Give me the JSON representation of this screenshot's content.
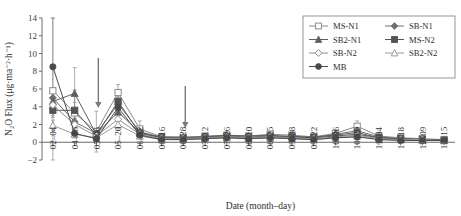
{
  "chart_data": {
    "type": "line",
    "title": "",
    "xlabel": "Date (month–day)",
    "ylabel": "N₂O Flux (μg·ma⁻²·h⁻¹)",
    "ylim": [
      -2,
      14
    ],
    "yticks": [
      -2,
      0,
      2,
      4,
      6,
      8,
      10,
      12,
      14
    ],
    "grid": false,
    "legend_position": "top-right",
    "categories": [
      "02–04",
      "04–15",
      "05–06",
      "05–20",
      "06–02",
      "06–16",
      "06–28",
      "07–12",
      "07–26",
      "08–10",
      "08–25",
      "09–08",
      "09–22",
      "10–06",
      "10–20",
      "11–04",
      "11–18",
      "12–09",
      "12–15"
    ],
    "series": [
      {
        "name": "MS-N1",
        "marker": "open-square",
        "color": "#8a8a8a",
        "values": [
          5.8,
          3.3,
          1.2,
          5.6,
          1.5,
          0.6,
          0.5,
          0.7,
          0.8,
          0.7,
          0.9,
          0.8,
          0.6,
          1.0,
          1.8,
          0.7,
          0.5,
          0.4,
          0.3
        ],
        "errors": [
          8.2,
          2.6,
          2.3,
          0.9,
          0.9,
          0.4,
          0.3,
          0.3,
          0.3,
          0.3,
          0.3,
          0.3,
          0.3,
          0.4,
          0.6,
          0.3,
          0.2,
          0.2,
          0.2
        ]
      },
      {
        "name": "SB-N1",
        "marker": "filled-diamond",
        "color": "#6f6f6f",
        "values": [
          5.0,
          2.3,
          1.0,
          4.3,
          1.2,
          0.5,
          0.5,
          0.6,
          0.7,
          0.6,
          0.7,
          0.7,
          0.5,
          0.9,
          1.3,
          0.6,
          0.4,
          0.3,
          0.3
        ],
        "errors": [
          1.1,
          1.0,
          0.5,
          0.8,
          0.5,
          0.3,
          0.2,
          0.2,
          0.2,
          0.2,
          0.2,
          0.2,
          0.2,
          0.3,
          0.4,
          0.2,
          0.2,
          0.2,
          0.1
        ]
      },
      {
        "name": "SB2-N1",
        "marker": "filled-triangle",
        "color": "#5f5f5f",
        "values": [
          4.6,
          5.5,
          0.9,
          3.4,
          1.1,
          0.6,
          0.6,
          0.6,
          0.8,
          0.7,
          0.8,
          0.6,
          0.6,
          0.8,
          1.1,
          0.5,
          0.4,
          0.3,
          0.3
        ],
        "errors": [
          0.9,
          2.9,
          0.4,
          0.7,
          0.4,
          0.3,
          0.2,
          0.2,
          0.2,
          0.2,
          0.2,
          0.2,
          0.2,
          0.2,
          0.3,
          0.2,
          0.2,
          0.1,
          0.1
        ]
      },
      {
        "name": "MS-N2",
        "marker": "filled-square",
        "color": "#545454",
        "values": [
          3.6,
          3.6,
          0.8,
          4.6,
          1.0,
          0.5,
          0.4,
          0.5,
          0.6,
          0.5,
          0.6,
          0.6,
          0.5,
          0.7,
          0.9,
          0.5,
          0.4,
          0.3,
          0.2
        ],
        "errors": [
          0.8,
          0.9,
          0.4,
          0.9,
          0.4,
          0.2,
          0.2,
          0.2,
          0.2,
          0.2,
          0.2,
          0.2,
          0.2,
          0.2,
          0.3,
          0.2,
          0.1,
          0.1,
          0.1
        ]
      },
      {
        "name": "SB-N2",
        "marker": "open-diamond",
        "color": "#909090",
        "values": [
          4.2,
          2.0,
          0.7,
          2.6,
          0.9,
          0.4,
          0.4,
          0.5,
          0.6,
          0.5,
          0.6,
          0.5,
          0.4,
          0.6,
          0.8,
          0.4,
          0.3,
          0.3,
          0.2
        ],
        "errors": [
          0.8,
          0.7,
          0.3,
          0.6,
          0.3,
          0.2,
          0.2,
          0.2,
          0.2,
          0.2,
          0.2,
          0.2,
          0.2,
          0.2,
          0.3,
          0.2,
          0.1,
          0.1,
          0.1
        ]
      },
      {
        "name": "SB2-N2",
        "marker": "open-triangle",
        "color": "#9b9b9b",
        "values": [
          1.9,
          0.9,
          0.5,
          2.0,
          0.7,
          0.3,
          0.3,
          0.4,
          0.5,
          0.4,
          0.5,
          0.4,
          0.3,
          0.5,
          0.7,
          0.3,
          0.3,
          0.2,
          0.2
        ],
        "errors": [
          0.6,
          0.4,
          0.3,
          0.5,
          0.3,
          0.2,
          0.2,
          0.2,
          0.2,
          0.2,
          0.2,
          0.2,
          0.2,
          0.2,
          0.2,
          0.1,
          0.1,
          0.1,
          0.1
        ]
      },
      {
        "name": "MB",
        "marker": "filled-circle",
        "color": "#4a4a4a",
        "values": [
          8.5,
          1.0,
          0.4,
          3.9,
          0.8,
          0.3,
          0.3,
          0.4,
          0.5,
          0.4,
          0.5,
          0.4,
          0.3,
          0.5,
          0.6,
          0.3,
          0.2,
          0.2,
          0.2
        ],
        "errors": [
          5.5,
          0.5,
          0.2,
          0.8,
          0.3,
          0.2,
          0.2,
          0.2,
          0.2,
          0.2,
          0.2,
          0.2,
          0.2,
          0.2,
          0.2,
          0.1,
          0.1,
          0.1,
          0.1
        ]
      }
    ],
    "annotations": [
      {
        "name": "arrow-fertilization-1",
        "at_category": "05–06",
        "label": ""
      },
      {
        "name": "arrow-fertilization-2",
        "at_category": "06–28",
        "label": ""
      }
    ]
  }
}
